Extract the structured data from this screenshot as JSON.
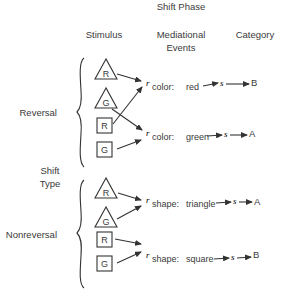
{
  "title": "Shift Phase",
  "headers": {
    "stimulus": "Stimulus",
    "mediational_line1": "Mediational",
    "mediational_line2": "Events",
    "category": "Category"
  },
  "shift_type": {
    "line1": "Shift",
    "line2": "Type"
  },
  "groups": [
    {
      "label": "Reversal",
      "stimuli": [
        {
          "shape": "triangle",
          "letter": "R"
        },
        {
          "shape": "triangle",
          "letter": "G"
        },
        {
          "shape": "square",
          "letter": "R"
        },
        {
          "shape": "square",
          "letter": "G"
        }
      ],
      "mediators": [
        {
          "r": "r",
          "dimension": "color:",
          "value": "red",
          "s": "s",
          "category": "B"
        },
        {
          "r": "r",
          "dimension": "color:",
          "value": "green",
          "s": "s",
          "category": "A"
        }
      ],
      "links": [
        {
          "from": "triangle R",
          "to": "color: red"
        },
        {
          "from": "triangle G",
          "to": "color: green"
        },
        {
          "from": "square R",
          "to": "color: red"
        },
        {
          "from": "square G",
          "to": "color: green"
        }
      ]
    },
    {
      "label": "Nonreversal",
      "stimuli": [
        {
          "shape": "triangle",
          "letter": "R"
        },
        {
          "shape": "triangle",
          "letter": "G"
        },
        {
          "shape": "square",
          "letter": "R"
        },
        {
          "shape": "square",
          "letter": "G"
        }
      ],
      "mediators": [
        {
          "r": "r",
          "dimension": "shape:",
          "value": "triangle",
          "s": "s",
          "category": "A"
        },
        {
          "r": "r",
          "dimension": "shape:",
          "value": "square",
          "s": "s",
          "category": "B"
        }
      ],
      "links": [
        {
          "from": "triangle R",
          "to": "shape: triangle"
        },
        {
          "from": "triangle G",
          "to": "shape: triangle"
        },
        {
          "from": "square R",
          "to": "shape: square"
        },
        {
          "from": "square G",
          "to": "shape: square"
        }
      ]
    }
  ]
}
